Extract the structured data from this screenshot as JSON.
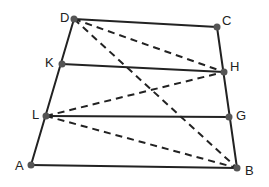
{
  "diagram": {
    "type": "trapezoid-with-midlines",
    "colors": {
      "stroke": "#222222",
      "point": "#555555",
      "background": "#ffffff"
    },
    "points": {
      "D": {
        "x": 74,
        "y": 19,
        "label": "D",
        "lx": 60,
        "ly": 19
      },
      "C": {
        "x": 217,
        "y": 27,
        "label": "C",
        "lx": 222,
        "ly": 22
      },
      "K": {
        "x": 62,
        "y": 64,
        "label": "K",
        "lx": 45,
        "ly": 64
      },
      "H": {
        "x": 224,
        "y": 72,
        "label": "H",
        "lx": 230,
        "ly": 68
      },
      "L": {
        "x": 46,
        "y": 116,
        "label": "L",
        "lx": 32,
        "ly": 116
      },
      "G": {
        "x": 229,
        "y": 117,
        "label": "G",
        "lx": 236,
        "ly": 117
      },
      "A": {
        "x": 31,
        "y": 165,
        "label": "A",
        "lx": 15,
        "ly": 167
      },
      "B": {
        "x": 237,
        "y": 168,
        "label": "B",
        "lx": 245,
        "ly": 172
      }
    },
    "solid_segments": [
      [
        "D",
        "C"
      ],
      [
        "A",
        "B"
      ],
      [
        "D",
        "A"
      ],
      [
        "C",
        "B"
      ],
      [
        "K",
        "H"
      ],
      [
        "L",
        "G"
      ]
    ],
    "dashed_segments": [
      [
        "D",
        "H"
      ],
      [
        "D",
        "B"
      ],
      [
        "L",
        "H"
      ],
      [
        "L",
        "B"
      ]
    ],
    "labels": [
      "D",
      "C",
      "K",
      "H",
      "L",
      "G",
      "A",
      "B"
    ]
  }
}
